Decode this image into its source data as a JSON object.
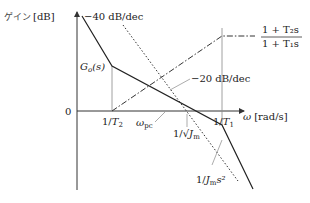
{
  "axes": {
    "y_label_jp": "ゲイン",
    "y_label_unit": "[dB]",
    "x_label_symbol": "ω",
    "x_label_unit": "[rad/s]",
    "origin_label": "0"
  },
  "ticks": {
    "inv_T2_num": "1/",
    "inv_T2_sym": "T",
    "inv_T2_sub": "2",
    "inv_T1_num": "1/",
    "inv_T1_sym": "T",
    "inv_T1_sub": "1",
    "omega_pc_sym": "ω",
    "omega_pc_sub": "pc",
    "inv_sqrtJm_num": "1/√",
    "inv_sqrtJm_sym": "J",
    "inv_sqrtJm_sub": "m"
  },
  "labels": {
    "slope_minus40": "−40 dB/dec",
    "slope_minus20": "−20 dB/dec",
    "go_s_sym": "G",
    "go_s_sub": "o",
    "go_s_arg": "(s)",
    "lead_lag_num": "1 + T₂s",
    "lead_lag_den": "1 + T₁s",
    "plant_num": "1/",
    "plant_sym": "J",
    "plant_sub": "m",
    "plant_s2": "s²"
  },
  "colors": {
    "axis": "#333333",
    "curve": "#222222",
    "guide": "#888888"
  }
}
